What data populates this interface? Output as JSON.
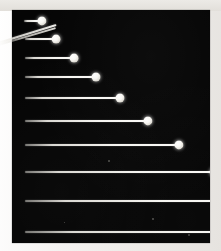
{
  "plate": {
    "title": "Stroboscopic multiple-exposure photograph of uniformly accelerated motion",
    "caption": "",
    "background_color": "#f2f0ee",
    "field_color": "#050505",
    "trace_color": "#f6f5f1",
    "ball_color": "#ffffff",
    "frame": {
      "x": 12,
      "y": 10,
      "width": 198,
      "height": 233
    }
  },
  "chart_data": {
    "type": "scatter",
    "subtitle": "",
    "xlabel": "",
    "ylabel": "",
    "xlim": [
      0,
      198
    ],
    "ylim": [
      0,
      233
    ],
    "grid": false,
    "legend": null,
    "series": [
      {
        "name": "exposure-traces",
        "x": [
          30,
          44,
          62,
          84,
          108,
          136,
          167,
          202,
          239,
          279
        ],
        "values": [
          10,
          28,
          47,
          66,
          87,
          110,
          134,
          161,
          190,
          221
        ],
        "traces": [
          {
            "index": 1,
            "start_x": 12,
            "end_x": 30,
            "y": 10,
            "length": 18,
            "ball_radius": 4.6
          },
          {
            "index": 2,
            "start_x": 13,
            "end_x": 44,
            "y": 28,
            "length": 31,
            "ball_radius": 4.4
          },
          {
            "index": 3,
            "start_x": 13,
            "end_x": 62,
            "y": 47,
            "length": 49,
            "ball_radius": 4.4
          },
          {
            "index": 4,
            "start_x": 13,
            "end_x": 84,
            "y": 66,
            "length": 71,
            "ball_radius": 4.5
          },
          {
            "index": 5,
            "start_x": 13,
            "end_x": 108,
            "y": 87,
            "length": 95,
            "ball_radius": 4.5
          },
          {
            "index": 6,
            "start_x": 13,
            "end_x": 136,
            "y": 110,
            "length": 123,
            "ball_radius": 4.6
          },
          {
            "index": 7,
            "start_x": 13,
            "end_x": 167,
            "y": 134,
            "length": 154,
            "ball_radius": 4.6
          },
          {
            "index": 8,
            "start_x": 13,
            "end_x": 202,
            "y": 161,
            "length": 189,
            "ball_radius": 4.4
          },
          {
            "index": 9,
            "start_x": 13,
            "end_x": 239,
            "y": 190,
            "length": 226,
            "ball_radius": 4.6
          },
          {
            "index": 10,
            "start_x": 13,
            "end_x": 279,
            "y": 221,
            "length": 266,
            "ball_radius": 4.6
          }
        ]
      },
      {
        "name": "entry-ramp-streaks",
        "description": "Two faint diagonal streaks running from the second ball down and to the left, exiting the frame.",
        "segments": [
          {
            "x1": 44,
            "y1": 14,
            "x2": -14,
            "y2": 32
          },
          {
            "x1": 44,
            "y1": 17,
            "x2": -14,
            "y2": 34
          }
        ]
      }
    ],
    "specks": [
      {
        "x": 96,
        "y": 150,
        "d": 1.6
      },
      {
        "x": 140,
        "y": 208,
        "d": 1.5
      },
      {
        "x": 176,
        "y": 224,
        "d": 2.2
      },
      {
        "x": 52,
        "y": 212,
        "d": 1.3
      }
    ]
  }
}
